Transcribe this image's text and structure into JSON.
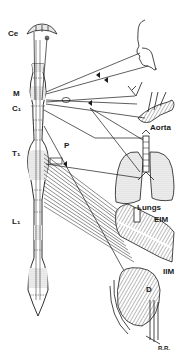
{
  "diagram": {
    "type": "anatomical",
    "labels": {
      "ce": "Ce",
      "m": "M",
      "c1": "C₁",
      "t1": "T₁",
      "l1": "L₁",
      "p": "P",
      "aorta": "Aorta",
      "lungs": "Lungs",
      "eim": "EIM",
      "iim": "IIM",
      "d": "D",
      "rr": "R.R."
    },
    "colors": {
      "ink": "#1a1a1a",
      "stipple": "#bdbdbd",
      "background": "#ffffff"
    }
  }
}
